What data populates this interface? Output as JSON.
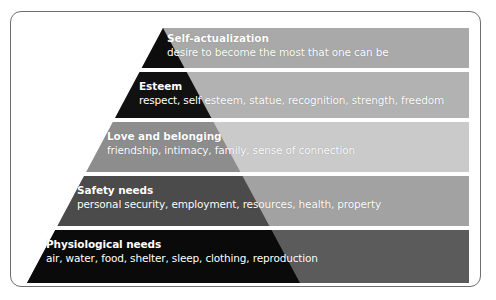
{
  "figure": {
    "name": "Maslow's hierarchy of needs pyramid",
    "background_color": "#ffffff",
    "card_border_color": "#6e6e6e"
  },
  "tiers": [
    {
      "id": "self-actualization",
      "title": "Self-actualization",
      "description": "desire to become the most that one can be",
      "band_color": "#a9a9a9",
      "pyramid_color": "#0d0d0d",
      "band_top": 28,
      "band_bottom": 68
    },
    {
      "id": "esteem",
      "title": "Esteem",
      "description": "respect, self esteem, statue, recognition, strength, freedom",
      "band_color": "#b2b2b2",
      "pyramid_color": "#111111",
      "band_top": 72,
      "band_bottom": 118
    },
    {
      "id": "love-and-belonging",
      "title": "Love and belonging",
      "description": "friendship, intimacy, family, sense of connection",
      "band_color": "#cacaca",
      "pyramid_color": "#8d8d8d",
      "band_top": 122,
      "band_bottom": 172
    },
    {
      "id": "safety-needs",
      "title": "Safety needs",
      "description": "personal security, employment, resources, health, property",
      "band_color": "#a2a2a2",
      "pyramid_color": "#4b4b4b",
      "band_top": 176,
      "band_bottom": 226
    },
    {
      "id": "physiological-needs",
      "title": "Physiological needs",
      "description": "air, water, food, shelter, sleep, clothing, reproduction",
      "band_color": "#5b5b5b",
      "pyramid_color": "#0a0a0a",
      "band_top": 230,
      "band_bottom": 283
    }
  ],
  "geometry": {
    "apex_x": 163,
    "apex_y": 28,
    "base_left_x": 27,
    "base_right_x": 300,
    "base_y": 283,
    "band_right_x": 469
  }
}
